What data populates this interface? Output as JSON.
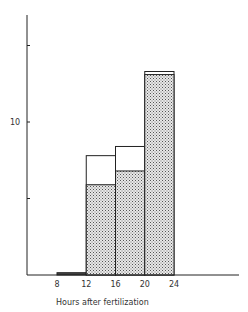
{
  "chart_data": {
    "type": "bar",
    "subtype": "stacked-histogram",
    "title": "",
    "xlabel": "Hours after fertilization",
    "ylabel": "",
    "x_ticks": [
      8,
      12,
      16,
      20,
      24
    ],
    "y_ticks": [
      5,
      10,
      15
    ],
    "y_tick_labels": [
      "",
      "10",
      ""
    ],
    "ylim": [
      0,
      16.5
    ],
    "xlim": [
      0,
      33
    ],
    "grid": false,
    "legend": null,
    "bins": [
      {
        "range": [
          8,
          12
        ],
        "label": "8-12"
      },
      {
        "range": [
          12,
          16
        ],
        "label": "12-16"
      },
      {
        "range": [
          16,
          20
        ],
        "label": "16-20"
      },
      {
        "range": [
          20,
          24
        ],
        "label": "20-24"
      }
    ],
    "categories": [
      "8-12",
      "12-16",
      "16-20",
      "20-24"
    ],
    "series": [
      {
        "name": "stippled (lower segment)",
        "pattern": "dotted-stipple",
        "values": [
          0.1,
          5.9,
          6.8,
          13.1
        ]
      },
      {
        "name": "open (upper segment)",
        "pattern": "white",
        "values": [
          0.05,
          1.9,
          1.6,
          0.2
        ]
      }
    ],
    "totals": [
      0.15,
      7.8,
      8.4,
      13.3
    ]
  },
  "axes": {
    "x_label": "Hours after fertilization",
    "x_tick_labels": [
      "8",
      "12",
      "16",
      "20",
      "24"
    ],
    "y_tick_label_10": "10"
  },
  "colors": {
    "line": "#222222",
    "stipple_bg": "#e6e6e6",
    "stipple_dot": "#555555",
    "open_fill": "#ffffff"
  }
}
